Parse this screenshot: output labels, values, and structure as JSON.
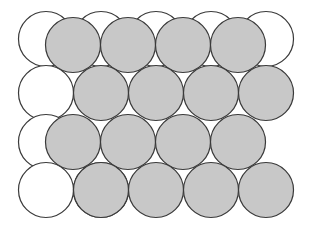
{
  "figure": {
    "type": "geometric-diagram",
    "canvas": {
      "width": 329,
      "height": 242,
      "background_color": "#ffffff"
    },
    "geometry": {
      "circle_radius": 27.5,
      "circle_diameter": 55,
      "row_spacing": 48,
      "column_spacing": 55,
      "row_offset": 27.5,
      "packing": "hexagonal-close-packed",
      "coordination_number": 6
    },
    "styles": {
      "shaded_fill": "#c8c8c8",
      "unshaded_fill": "#ffffff",
      "stroke_color": "#3a3a3a",
      "stroke_width": 1.2
    },
    "layers": [
      {
        "name": "back-layer",
        "label": "Unshaded lower layer",
        "fill": "#ffffff",
        "circles": [
          {
            "cx": 46,
            "cy": 39
          },
          {
            "cx": 101,
            "cy": 39
          },
          {
            "cx": 156,
            "cy": 39
          },
          {
            "cx": 211,
            "cy": 39
          },
          {
            "cx": 266,
            "cy": 39
          },
          {
            "cx": 46,
            "cy": 93
          },
          {
            "cx": 46,
            "cy": 142
          },
          {
            "cx": 46,
            "cy": 190
          },
          {
            "cx": 101,
            "cy": 190
          }
        ]
      },
      {
        "name": "front-layer",
        "label": "Shaded upper layer",
        "fill": "#c8c8c8",
        "circles": [
          {
            "cx": 73,
            "cy": 45
          },
          {
            "cx": 128,
            "cy": 45
          },
          {
            "cx": 183,
            "cy": 45
          },
          {
            "cx": 238,
            "cy": 45
          },
          {
            "cx": 101,
            "cy": 93
          },
          {
            "cx": 156,
            "cy": 93
          },
          {
            "cx": 211,
            "cy": 93
          },
          {
            "cx": 266,
            "cy": 93
          },
          {
            "cx": 73,
            "cy": 142
          },
          {
            "cx": 128,
            "cy": 142
          },
          {
            "cx": 183,
            "cy": 142
          },
          {
            "cx": 238,
            "cy": 142
          },
          {
            "cx": 101,
            "cy": 190
          },
          {
            "cx": 156,
            "cy": 190
          },
          {
            "cx": 211,
            "cy": 190
          },
          {
            "cx": 266,
            "cy": 190
          }
        ]
      }
    ]
  }
}
